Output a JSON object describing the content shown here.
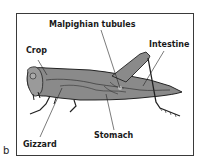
{
  "figure": {
    "panel_label": "b",
    "labels": {
      "malpighian": "Malpighian tubules",
      "crop": "Crop",
      "intestine": "Intestine",
      "gizzard": "Gizzard",
      "stomach": "Stomach"
    },
    "colors": {
      "body_fill": "#8a8a8a",
      "outline": "#222222",
      "background": "#ffffff"
    }
  }
}
